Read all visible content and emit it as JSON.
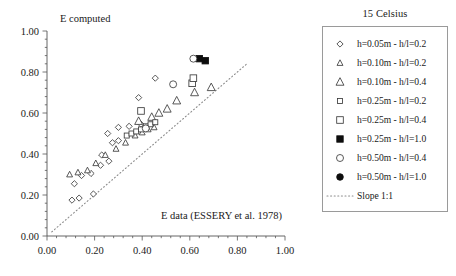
{
  "legend": {
    "title": "15 Celsius",
    "entries": [
      {
        "label": "h=0.05m - h/l=0.2",
        "marker": "diamond-open-small",
        "key": "d005_02"
      },
      {
        "label": "h=0.10m - h/l=0.2",
        "marker": "triangle-open-small",
        "key": "t010_02"
      },
      {
        "label": "h=0.10m - h/l=0.4",
        "marker": "triangle-open-large",
        "key": "t010_04"
      },
      {
        "label": "h=0.25m - h/l=0.2",
        "marker": "square-open-small",
        "key": "s025_02"
      },
      {
        "label": "h=0.25m - h/l=0.4",
        "marker": "square-open-large",
        "key": "s025_04"
      },
      {
        "label": "h=0.25m - h/l=1.0",
        "marker": "square-filled",
        "key": "s025_10"
      },
      {
        "label": "h=0.50m - h/l=0.4",
        "marker": "circle-open",
        "key": "c050_04"
      },
      {
        "label": "h=0.50m - h/l=1.0",
        "marker": "circle-filled",
        "key": "c050_10"
      },
      {
        "label": "Slope 1:1",
        "marker": "dotted-line",
        "key": "slope11"
      }
    ]
  },
  "chart_data": {
    "type": "scatter",
    "title": "",
    "xlabel": "E data (ESSERY et al. 1978)",
    "ylabel": "E computed",
    "xlim": [
      0.0,
      1.0
    ],
    "ylim": [
      0.0,
      1.0
    ],
    "xticks": [
      "0.00",
      "0.20",
      "0.40",
      "0.60",
      "0.80",
      "1.00"
    ],
    "xtick_values": [
      0.0,
      0.2,
      0.4,
      0.6,
      0.8,
      1.0
    ],
    "yticks": [
      "0.00",
      "0.20",
      "0.40",
      "0.60",
      "0.80",
      "1.00"
    ],
    "ytick_values": [
      0.0,
      0.2,
      0.4,
      0.6,
      0.8,
      1.0
    ],
    "minor_ticks_per_interval": 4,
    "grid": false,
    "legend_position": "right-outside",
    "reference_line": {
      "name": "Slope 1:1",
      "from": [
        0.02,
        0.02
      ],
      "to": [
        0.84,
        0.84
      ],
      "style": "dotted"
    },
    "series": [
      {
        "name": "h=0.05m - h/l=0.2",
        "marker": "diamond-open-small",
        "points": [
          [
            0.105,
            0.175
          ],
          [
            0.135,
            0.185
          ],
          [
            0.195,
            0.205
          ],
          [
            0.115,
            0.255
          ],
          [
            0.145,
            0.295
          ],
          [
            0.185,
            0.305
          ],
          [
            0.225,
            0.345
          ],
          [
            0.26,
            0.365
          ],
          [
            0.23,
            0.395
          ],
          [
            0.275,
            0.455
          ],
          [
            0.3,
            0.465
          ],
          [
            0.255,
            0.5
          ],
          [
            0.3,
            0.53
          ],
          [
            0.345,
            0.535
          ],
          [
            0.395,
            0.545
          ],
          [
            0.385,
            0.675
          ],
          [
            0.455,
            0.77
          ]
        ]
      },
      {
        "name": "h=0.10m - h/l=0.2",
        "marker": "triangle-open-small",
        "points": [
          [
            0.095,
            0.3
          ],
          [
            0.13,
            0.31
          ],
          [
            0.17,
            0.32
          ],
          [
            0.205,
            0.355
          ],
          [
            0.245,
            0.395
          ],
          [
            0.29,
            0.425
          ],
          [
            0.33,
            0.455
          ],
          [
            0.37,
            0.49
          ],
          [
            0.4,
            0.505
          ],
          [
            0.425,
            0.52
          ],
          [
            0.45,
            0.53
          ]
        ]
      },
      {
        "name": "h=0.10m - h/l=0.4",
        "marker": "triangle-open-large",
        "points": [
          [
            0.385,
            0.56
          ],
          [
            0.44,
            0.58
          ],
          [
            0.47,
            0.6
          ],
          [
            0.505,
            0.62
          ],
          [
            0.545,
            0.66
          ],
          [
            0.62,
            0.7
          ],
          [
            0.69,
            0.725
          ]
        ]
      },
      {
        "name": "h=0.25m - h/l=0.2",
        "marker": "square-open-small",
        "points": [
          [
            0.335,
            0.49
          ],
          [
            0.355,
            0.5
          ],
          [
            0.375,
            0.51
          ],
          [
            0.395,
            0.52
          ],
          [
            0.415,
            0.535
          ],
          [
            0.435,
            0.545
          ],
          [
            0.455,
            0.555
          ]
        ]
      },
      {
        "name": "h=0.25m - h/l=0.4",
        "marker": "square-open-large",
        "points": [
          [
            0.395,
            0.61
          ],
          [
            0.61,
            0.745
          ],
          [
            0.615,
            0.77
          ]
        ]
      },
      {
        "name": "h=0.25m - h/l=1.0",
        "marker": "square-filled",
        "points": [
          [
            0.64,
            0.865
          ],
          [
            0.665,
            0.855
          ]
        ]
      },
      {
        "name": "h=0.50m - h/l=0.4",
        "marker": "circle-open",
        "points": [
          [
            0.415,
            0.525
          ],
          [
            0.53,
            0.74
          ],
          [
            0.615,
            0.865
          ]
        ]
      },
      {
        "name": "h=0.50m - h/l=1.0",
        "marker": "circle-filled",
        "points": []
      }
    ]
  }
}
